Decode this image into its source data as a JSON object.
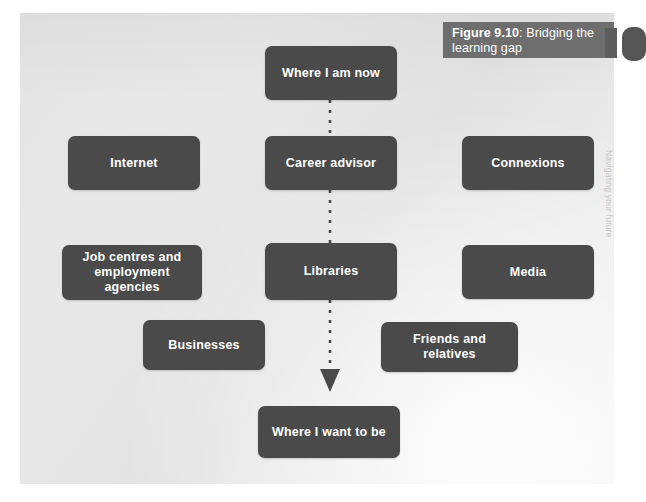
{
  "figure": {
    "caption_bold": "Figure 9.10",
    "caption_rest": ": Bridging the learning gap",
    "caption_full": "Figure 9.10: Bridging the learning gap"
  },
  "margin_note": {
    "text": "Navigating your future"
  },
  "colors": {
    "node_fill": "#4a4a4a",
    "node_text": "#ffffff",
    "caption_bar": "#6e6e6e",
    "panel_background": "#e8e8e8",
    "page_background": "#ffffff",
    "connector": "#4a4a4a"
  },
  "diagram": {
    "type": "flow-diagram",
    "title": "Bridging the learning gap",
    "nodes": [
      {
        "id": "where-i-am-now",
        "label": "Where I am now",
        "column": "center",
        "x": 265,
        "y": 46,
        "w": 132,
        "h": 54
      },
      {
        "id": "internet",
        "label": "Internet",
        "column": "left",
        "x": 68,
        "y": 136,
        "w": 132,
        "h": 54
      },
      {
        "id": "career-advisor",
        "label": "Career advisor",
        "column": "center",
        "x": 265,
        "y": 136,
        "w": 132,
        "h": 54
      },
      {
        "id": "connexions",
        "label": "Connexions",
        "column": "right",
        "x": 462,
        "y": 136,
        "w": 132,
        "h": 54
      },
      {
        "id": "job-centres",
        "label": "Job centres and employment agencies",
        "column": "left",
        "x": 62,
        "y": 245,
        "w": 140,
        "h": 55
      },
      {
        "id": "libraries",
        "label": "Libraries",
        "column": "center",
        "x": 265,
        "y": 243,
        "w": 132,
        "h": 57
      },
      {
        "id": "media",
        "label": "Media",
        "column": "right",
        "x": 462,
        "y": 245,
        "w": 132,
        "h": 54
      },
      {
        "id": "businesses",
        "label": "Businesses",
        "column": "left",
        "x": 143,
        "y": 320,
        "w": 122,
        "h": 50
      },
      {
        "id": "friends-and-relatives",
        "label": "Friends and relatives",
        "column": "right",
        "x": 381,
        "y": 322,
        "w": 137,
        "h": 50
      },
      {
        "id": "where-i-want-to-be",
        "label": "Where I want to be",
        "column": "center",
        "x": 258,
        "y": 406,
        "w": 142,
        "h": 52
      }
    ],
    "connector": {
      "style": "dashed",
      "from": "where-i-am-now",
      "to": "where-i-want-to-be",
      "arrowhead": "down",
      "passes_through": [
        "career-advisor",
        "libraries"
      ]
    }
  }
}
